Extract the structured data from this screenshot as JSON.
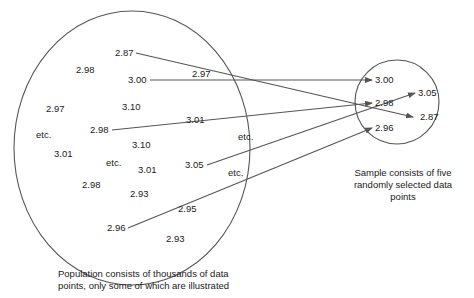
{
  "population": {
    "caption_line1": "Population consists of thousands of data",
    "caption_line2": "points, only some of which are illustrated",
    "values": [
      {
        "text": "2.87",
        "x": 115,
        "y": 56
      },
      {
        "text": "2.98",
        "x": 76,
        "y": 73
      },
      {
        "text": "3.00",
        "x": 128,
        "y": 83
      },
      {
        "text": "2.97",
        "x": 46,
        "y": 112
      },
      {
        "text": "3.10",
        "x": 122,
        "y": 110
      },
      {
        "text": "etc.",
        "x": 36,
        "y": 138
      },
      {
        "text": "2.98",
        "x": 90,
        "y": 133
      },
      {
        "text": "3.10",
        "x": 132,
        "y": 148
      },
      {
        "text": "3.01",
        "x": 54,
        "y": 157
      },
      {
        "text": "etc.",
        "x": 106,
        "y": 166
      },
      {
        "text": "3.01",
        "x": 138,
        "y": 173
      },
      {
        "text": "2.98",
        "x": 82,
        "y": 188
      },
      {
        "text": "2.93",
        "x": 130,
        "y": 197
      },
      {
        "text": "3.05",
        "x": 185,
        "y": 168
      },
      {
        "text": "etc.",
        "x": 228,
        "y": 176
      },
      {
        "text": "2.95",
        "x": 178,
        "y": 212
      },
      {
        "text": "2.96",
        "x": 107,
        "y": 231
      },
      {
        "text": "2.93",
        "x": 166,
        "y": 242
      },
      {
        "text": "2.97",
        "x": 192,
        "y": 77
      },
      {
        "text": "3.01",
        "x": 186,
        "y": 123
      },
      {
        "text": "etc.",
        "x": 238,
        "y": 140
      }
    ]
  },
  "sample": {
    "caption_line1": "Sample consists of five",
    "caption_line2": "randomly selected data",
    "caption_line3": "points",
    "values": [
      {
        "text": "3.00",
        "x": 375,
        "y": 83
      },
      {
        "text": "3.05",
        "x": 418,
        "y": 96
      },
      {
        "text": "2.98",
        "x": 375,
        "y": 106
      },
      {
        "text": "2.87",
        "x": 420,
        "y": 120
      },
      {
        "text": "2.96",
        "x": 375,
        "y": 131
      }
    ]
  },
  "arrows": [
    {
      "from": "2.87",
      "to": "2.87"
    },
    {
      "from": "3.00",
      "to": "3.00"
    },
    {
      "from": "2.98",
      "to": "2.98"
    },
    {
      "from": "3.05",
      "to": "3.05"
    },
    {
      "from": "2.96",
      "to": "2.96"
    }
  ]
}
